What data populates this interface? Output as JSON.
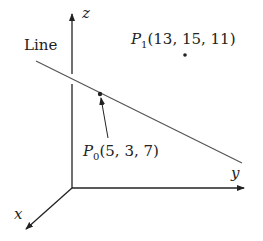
{
  "axes": {
    "x_label": "x",
    "y_label": "y",
    "z_label": "z"
  },
  "line": {
    "label": "Line"
  },
  "points": [
    {
      "name": "P",
      "sub": "0",
      "coords": "(5, 3, 7)"
    },
    {
      "name": "P",
      "sub": "1",
      "coords": "(13, 15, 11)"
    }
  ],
  "colors": {
    "stroke": "#222222",
    "line": "#555555"
  }
}
